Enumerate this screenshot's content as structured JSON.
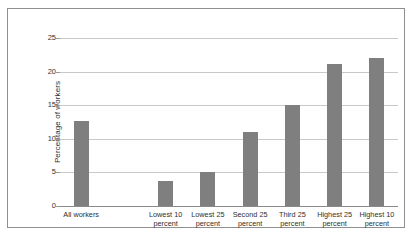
{
  "chart_data": {
    "type": "bar",
    "title": "",
    "subtitle": "",
    "xlabel": "",
    "ylabel": "Percentage of workers",
    "ylim": [
      0,
      25
    ],
    "ytick_labels": [
      "0",
      "5",
      "10",
      "15",
      "20",
      "25"
    ],
    "ytick_values": [
      0,
      5,
      10,
      15,
      20,
      25
    ],
    "grid": true,
    "legend": null,
    "bar_color": "#7f7f7f",
    "gridline_color": "#c9c9c9",
    "axis_color": "#8a8a8a",
    "border_color": "#8f8f8f",
    "categories": [
      "All workers",
      "",
      "Lowest 10 percent",
      "Lowest 25 percent",
      "Second 25 percent",
      "Third 25 percent",
      "Highest 25 percent",
      "Highest 10 percent"
    ],
    "values": [
      12.7,
      null,
      3.7,
      5.1,
      11.0,
      15.0,
      21.2,
      22.0
    ],
    "bars": [
      {
        "label_line1": "All workers",
        "label_line2": "",
        "value": 12.7
      },
      {
        "label_line1": "",
        "label_line2": "",
        "value": null
      },
      {
        "label_line1": "Lowest 10",
        "label_line2": "percent",
        "value": 3.7
      },
      {
        "label_line1": "Lowest 25",
        "label_line2": "percent",
        "value": 5.1
      },
      {
        "label_line1": "Second 25",
        "label_line2": "percent",
        "value": 11.0
      },
      {
        "label_line1": "Third 25",
        "label_line2": "percent",
        "value": 15.0
      },
      {
        "label_line1": "Highest 25",
        "label_line2": "percent",
        "value": 21.2
      },
      {
        "label_line1": "Highest 10",
        "label_line2": "percent",
        "value": 22.0
      }
    ]
  },
  "axis": {
    "y_ticks": [
      {
        "label": "25",
        "value": 25
      },
      {
        "label": "20",
        "value": 20
      },
      {
        "label": "15",
        "value": 15
      },
      {
        "label": "10",
        "value": 10
      },
      {
        "label": "5",
        "value": 5
      },
      {
        "label": "0",
        "value": 0
      }
    ],
    "y_title": "Percentage of workers"
  },
  "x_labels": [
    {
      "line1": "All workers",
      "line2": ""
    },
    {
      "line1": "Lowest 10",
      "line2": "percent"
    },
    {
      "line1": "Lowest 25",
      "line2": "percent"
    },
    {
      "line1": "Second 25",
      "line2": "percent"
    },
    {
      "line1": "Third 25",
      "line2": "percent"
    },
    {
      "line1": "Highest 25",
      "line2": "percent"
    },
    {
      "line1": "Highest 10",
      "line2": "percent"
    }
  ]
}
